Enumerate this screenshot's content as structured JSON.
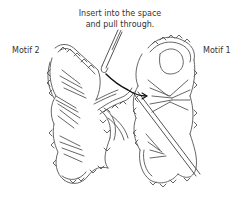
{
  "diagram": {
    "instruction": {
      "line1": "Insert into the space",
      "line2": "and pull through."
    },
    "labels": {
      "left_motif": "Motif 2",
      "right_motif": "Motif 1"
    },
    "colors": {
      "stroke": "#444444",
      "yarn_accent": "#111111",
      "background": "#ffffff"
    }
  }
}
